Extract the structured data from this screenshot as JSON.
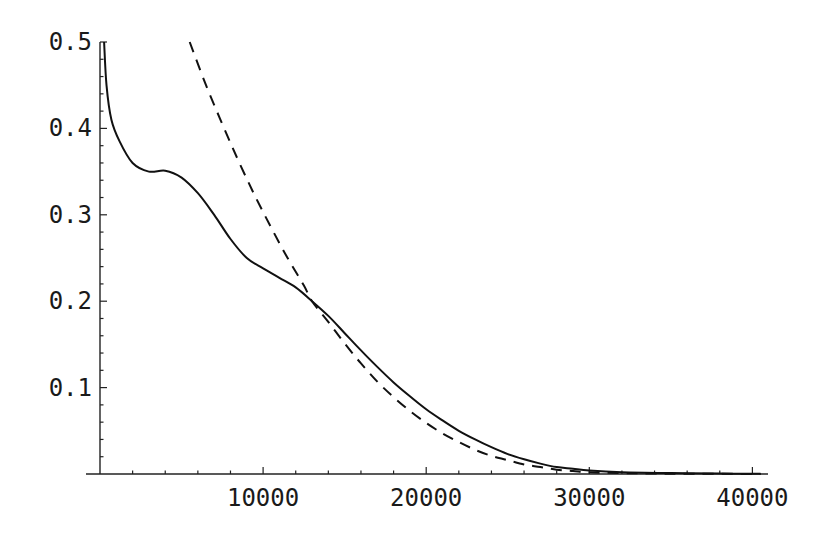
{
  "chart_data": {
    "type": "line",
    "title": "",
    "xlabel": "",
    "ylabel": "",
    "xlim": [
      0,
      41000
    ],
    "ylim": [
      0,
      0.5
    ],
    "grid": false,
    "legend": null,
    "x_ticks": [
      10000,
      20000,
      30000,
      40000
    ],
    "x_tick_labels": [
      "10000",
      "20000",
      "30000",
      "40000"
    ],
    "y_ticks": [
      0.1,
      0.2,
      0.3,
      0.4,
      0.5
    ],
    "y_tick_labels": [
      "0.1",
      "0.2",
      "0.3",
      "0.4",
      "0.5"
    ],
    "series": [
      {
        "name": "solid",
        "style": "solid",
        "color": "#111111",
        "points": [
          [
            250,
            0.5
          ],
          [
            400,
            0.45
          ],
          [
            700,
            0.41
          ],
          [
            1200,
            0.385
          ],
          [
            2000,
            0.36
          ],
          [
            3000,
            0.35
          ],
          [
            4000,
            0.351
          ],
          [
            5000,
            0.343
          ],
          [
            6000,
            0.325
          ],
          [
            7000,
            0.3
          ],
          [
            8000,
            0.272
          ],
          [
            9000,
            0.25
          ],
          [
            10000,
            0.238
          ],
          [
            11000,
            0.227
          ],
          [
            12000,
            0.216
          ],
          [
            13000,
            0.2
          ],
          [
            14000,
            0.183
          ],
          [
            15000,
            0.163
          ],
          [
            16000,
            0.143
          ],
          [
            17000,
            0.124
          ],
          [
            18000,
            0.106
          ],
          [
            19000,
            0.09
          ],
          [
            20000,
            0.075
          ],
          [
            21000,
            0.062
          ],
          [
            22000,
            0.05
          ],
          [
            23000,
            0.04
          ],
          [
            24000,
            0.031
          ],
          [
            25000,
            0.023
          ],
          [
            26000,
            0.017
          ],
          [
            27000,
            0.012
          ],
          [
            28000,
            0.008
          ],
          [
            29000,
            0.006
          ],
          [
            30000,
            0.004
          ],
          [
            32000,
            0.002
          ],
          [
            35000,
            0.001
          ],
          [
            38000,
            0.0005
          ],
          [
            40500,
            0.0003
          ]
        ]
      },
      {
        "name": "dashed",
        "style": "dashed",
        "color": "#111111",
        "points": [
          [
            5500,
            0.5
          ],
          [
            6500,
            0.45
          ],
          [
            7500,
            0.405
          ],
          [
            8500,
            0.362
          ],
          [
            9500,
            0.322
          ],
          [
            10500,
            0.285
          ],
          [
            11500,
            0.25
          ],
          [
            12500,
            0.218
          ],
          [
            13000,
            0.2
          ],
          [
            14000,
            0.176
          ],
          [
            15000,
            0.151
          ],
          [
            16000,
            0.128
          ],
          [
            17000,
            0.107
          ],
          [
            18000,
            0.089
          ],
          [
            19000,
            0.073
          ],
          [
            20000,
            0.059
          ],
          [
            21000,
            0.047
          ],
          [
            22000,
            0.037
          ],
          [
            23000,
            0.028
          ],
          [
            24000,
            0.021
          ],
          [
            25000,
            0.016
          ],
          [
            26000,
            0.011
          ],
          [
            27000,
            0.008
          ],
          [
            28000,
            0.005
          ],
          [
            29000,
            0.0035
          ],
          [
            30000,
            0.002
          ],
          [
            32000,
            0.001
          ],
          [
            35000,
            0.0004
          ],
          [
            40500,
            0.0001
          ]
        ]
      }
    ]
  },
  "layout": {
    "x0_px": 100,
    "x_scale": 0.01631,
    "y0_px": 474,
    "y_scale": 864,
    "x_axis_start_px": 86,
    "x_axis_end_px": 768,
    "y_axis_top_px": 42,
    "x_minor_step": 2000,
    "y_minor_step": 0.02
  }
}
